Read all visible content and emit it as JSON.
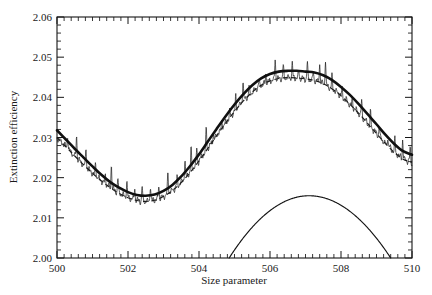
{
  "chart_data": {
    "type": "line",
    "title": "",
    "xlabel": "Size parameter",
    "ylabel": "Extinction efficiency",
    "xlim": [
      500,
      510
    ],
    "ylim": [
      2.0,
      2.06
    ],
    "grid": false,
    "legend": "none",
    "x_ticks": [
      500,
      502,
      504,
      506,
      508,
      510
    ],
    "x_tick_labels": [
      "500",
      "502",
      "504",
      "506",
      "508",
      "510"
    ],
    "x_minor_tick_step": 0.2,
    "y_ticks": [
      2.0,
      2.01,
      2.02,
      2.03,
      2.04,
      2.05,
      2.06
    ],
    "y_tick_labels": [
      "2.00",
      "2.01",
      "2.02",
      "2.03",
      "2.04",
      "2.05",
      "2.06"
    ],
    "y_minor_tick_step": 0.002,
    "series": [
      {
        "name": "smooth-thick-curve",
        "style": "solid-thick",
        "description": "Smooth sinusoidal extinction efficiency curve",
        "x": [
          500.0,
          500.25,
          500.5,
          500.75,
          501.0,
          501.25,
          501.5,
          501.75,
          502.0,
          502.25,
          502.5,
          502.75,
          503.0,
          503.25,
          503.5,
          503.75,
          504.0,
          504.25,
          504.5,
          504.75,
          505.0,
          505.25,
          505.5,
          505.75,
          506.0,
          506.25,
          506.5,
          506.75,
          507.0,
          507.25,
          507.5,
          507.75,
          508.0,
          508.25,
          508.5,
          508.75,
          509.0,
          509.25,
          509.5,
          509.75,
          510.0
        ],
        "y": [
          2.0318,
          2.0295,
          2.0272,
          2.025,
          2.0228,
          2.0207,
          2.0189,
          2.0175,
          2.0164,
          2.0157,
          2.0155,
          2.0158,
          2.0167,
          2.0182,
          2.0203,
          2.0229,
          2.0258,
          2.029,
          2.0322,
          2.0353,
          2.0382,
          2.0408,
          2.043,
          2.0447,
          2.0458,
          2.0464,
          2.0466,
          2.0466,
          2.0464,
          2.0462,
          2.0455,
          2.0443,
          2.0426,
          2.0406,
          2.0383,
          2.0358,
          2.0333,
          2.0307,
          2.0284,
          2.0266,
          2.0257
        ]
      },
      {
        "name": "dashed-curve",
        "style": "dashed",
        "description": "Dashed approximation curve lying slightly below the thick curve",
        "x": [
          500.0,
          500.25,
          500.5,
          500.75,
          501.0,
          501.25,
          501.5,
          501.75,
          502.0,
          502.25,
          502.5,
          502.75,
          503.0,
          503.25,
          503.5,
          503.75,
          504.0,
          504.25,
          504.5,
          504.75,
          505.0,
          505.25,
          505.5,
          505.75,
          506.0,
          506.25,
          506.5,
          506.75,
          507.0,
          507.25,
          507.5,
          507.75,
          508.0,
          508.25,
          508.5,
          508.75,
          509.0,
          509.25,
          509.5,
          509.75,
          510.0
        ],
        "y": [
          2.03,
          2.0277,
          2.0254,
          2.0232,
          2.0211,
          2.0192,
          2.0175,
          2.0161,
          2.015,
          2.0143,
          2.0141,
          2.0144,
          2.0153,
          2.0168,
          2.0188,
          2.0213,
          2.0242,
          2.0273,
          2.0305,
          2.0336,
          2.0365,
          2.0391,
          2.0413,
          2.043,
          2.0441,
          2.0447,
          2.0449,
          2.0448,
          2.0446,
          2.0442,
          2.0434,
          2.0421,
          2.0404,
          2.0383,
          2.036,
          2.0335,
          2.031,
          2.0285,
          2.0263,
          2.0246,
          2.0238
        ]
      },
      {
        "name": "noisy-trace",
        "style": "solid-thin-spiky",
        "description": "Noisy ripple trace with sharp upward resonance spikes oscillating about the smooth curve"
      },
      {
        "name": "parabolic-arc",
        "style": "solid-thin",
        "description": "Thin parabolic arc rising from the baseline",
        "x_start": 504.85,
        "x_peak": 507.1,
        "x_end": 509.4,
        "y_peak": 2.0155,
        "y_baseline": 2.0
      }
    ]
  },
  "axes": {
    "x_axis_name": "Size parameter",
    "y_axis_name": "Extinction efficiency"
  }
}
